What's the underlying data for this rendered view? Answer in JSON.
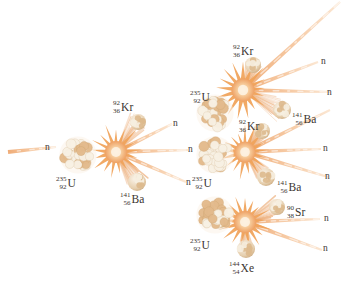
{
  "figure": {
    "background_color": "#ffffff",
    "palette": {
      "trail_orange": "#f0a868",
      "trail_light": "#f8cfa8",
      "burst_orange": "#f0a05a",
      "burst_core": "#fbe3c2",
      "nucleon_tan": "#e8c49a",
      "nucleon_light": "#f7efe2",
      "label_color": "#3a3430"
    }
  },
  "labels": {
    "neutron": "n",
    "uranium": {
      "mass": "235",
      "atomic": "92",
      "symbol": "U"
    },
    "krypton": {
      "mass": "92",
      "atomic": "36",
      "symbol": "Kr"
    },
    "barium": {
      "mass": "141",
      "atomic": "56",
      "symbol": "Ba"
    },
    "strontium": {
      "mass": "90",
      "atomic": "38",
      "symbol": "Sr"
    },
    "xenon": {
      "mass": "144",
      "atomic": "54",
      "symbol": "Xe"
    }
  },
  "generations": [
    {
      "id": "gen-1",
      "fission_index": 1,
      "nucleus": {
        "x": 78,
        "y": 155,
        "r": 19,
        "label": "uranium",
        "label_x": 56,
        "label_y": 176
      },
      "burst": {
        "x": 116,
        "y": 152,
        "r": 25
      },
      "products": [
        {
          "type": "krypton",
          "x": 138,
          "y": 122,
          "r": 8,
          "label_x": 113,
          "label_y": 100
        },
        {
          "type": "barium",
          "x": 137,
          "y": 182,
          "r": 9,
          "label_x": 120,
          "label_y": 192
        }
      ],
      "neutrons": [
        {
          "label_x": 173,
          "label_y": 119
        },
        {
          "label_x": 188,
          "label_y": 145
        },
        {
          "label_x": 186,
          "label_y": 178
        }
      ]
    },
    {
      "id": "gen-2-top",
      "fission_index": 2,
      "nucleus": {
        "x": 215,
        "y": 113,
        "r": 19,
        "label": "uranium",
        "label_x": 190,
        "label_y": 90
      },
      "burst": {
        "x": 243,
        "y": 90,
        "r": 26
      },
      "products": [
        {
          "type": "krypton",
          "x": 253,
          "y": 65,
          "r": 8,
          "label_x": 233,
          "label_y": 44
        },
        {
          "type": "barium",
          "x": 282,
          "y": 110,
          "r": 9,
          "label_x": 292,
          "label_y": 112
        }
      ],
      "neutrons": [
        {
          "label_x": 321,
          "label_y": 57
        },
        {
          "label_x": 327,
          "label_y": 88
        }
      ]
    },
    {
      "id": "gen-2-middle",
      "fission_index": 3,
      "nucleus": {
        "x": 215,
        "y": 155,
        "r": 19,
        "label": "uranium",
        "label_x": 192,
        "label_y": 176
      },
      "burst": {
        "x": 245,
        "y": 152,
        "r": 24
      },
      "products": [
        {
          "type": "krypton",
          "x": 262,
          "y": 131,
          "r": 8,
          "label_x": 239,
          "label_y": 119
        },
        {
          "type": "barium",
          "x": 266,
          "y": 177,
          "r": 9,
          "label_x": 277,
          "label_y": 180
        }
      ],
      "neutrons": [
        {
          "label_x": 323,
          "label_y": 144
        },
        {
          "label_x": 325,
          "label_y": 172
        }
      ]
    },
    {
      "id": "gen-2-bottom",
      "fission_index": 4,
      "nucleus": {
        "x": 215,
        "y": 215,
        "r": 19,
        "label": "uranium",
        "label_x": 190,
        "label_y": 238
      },
      "burst": {
        "x": 245,
        "y": 222,
        "r": 25
      },
      "products": [
        {
          "type": "strontium",
          "x": 277,
          "y": 207,
          "r": 8,
          "label_x": 287,
          "label_y": 205
        },
        {
          "type": "xenon",
          "x": 246,
          "y": 249,
          "r": 9,
          "label_x": 229,
          "label_y": 261
        }
      ],
      "neutrons": [
        {
          "label_x": 324,
          "label_y": 214
        },
        {
          "label_x": 323,
          "label_y": 244
        }
      ]
    }
  ],
  "incident_neutron": {
    "label_x": 45,
    "label_y": 143,
    "trail_from_x": 8,
    "trail_from_y": 152,
    "trail_to_x": 56,
    "trail_to_y": 147
  }
}
